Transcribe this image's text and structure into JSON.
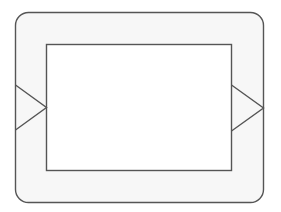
{
  "diagram": {
    "colors": {
      "background": "#ffffff",
      "frame_fill": "#f7f7f7",
      "inner_fill": "#ffffff",
      "stroke": "#555555"
    },
    "outer_frame": {
      "x": 15.5,
      "y": 12.5,
      "width": 248,
      "height": 190,
      "radius": 13
    },
    "inner_rect": {
      "x": 46.5,
      "y": 44.5,
      "width": 185,
      "height": 126
    },
    "left_arrow": {
      "points": "15.5,85 46.5,107.5 15.5,130"
    },
    "right_arrow": {
      "points": "231.5,85 263.5,108 231.5,131"
    }
  }
}
